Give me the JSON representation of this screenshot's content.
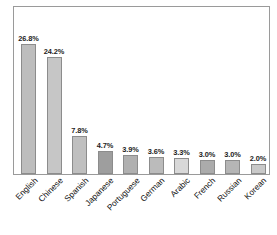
{
  "chart_data": {
    "type": "bar",
    "title": "",
    "subtitle": "",
    "xlabel": "",
    "ylabel": "",
    "ylim": [
      0,
      30
    ],
    "grid": false,
    "legend": "none",
    "orientation": "vertical",
    "value_label_suffix": "%",
    "categories": [
      "English",
      "Chinese",
      "Spanish",
      "Japanese",
      "Portuguese",
      "German",
      "Arabic",
      "French",
      "Russian",
      "Korean"
    ],
    "values": [
      26.8,
      24.2,
      7.8,
      4.7,
      3.9,
      3.6,
      3.3,
      3.0,
      3.0,
      2.0
    ],
    "value_labels": [
      "26.8%",
      "24.2%",
      "7.8%",
      "4.7%",
      "3.9%",
      "3.6%",
      "3.3%",
      "3.0%",
      "3.0%",
      "2.0%"
    ],
    "bar_colors": [
      "#bdbdbd",
      "#c6c6c6",
      "#bfbfbf",
      "#9e9e9e",
      "#b0b0b0",
      "#bbbbbb",
      "#d8d8d8",
      "#ababab",
      "#b5b5b5",
      "#c9c9c9"
    ],
    "frame_color": "#9a9a9a",
    "plot_background": "#ffffff",
    "bar_border_color": "#8c8c8c",
    "label_text_color": "#1c1c1c",
    "category_text_color": "#111111"
  }
}
